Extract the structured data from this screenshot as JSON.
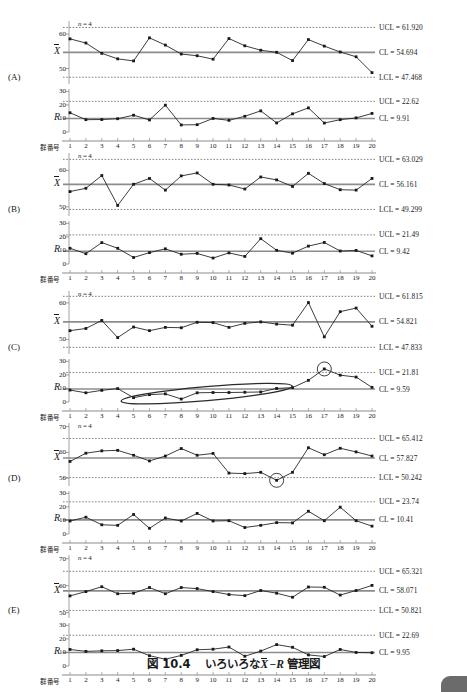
{
  "caption": {
    "number": "図 10.4",
    "text_before": "いろいろな",
    "x_symbol": "X",
    "dash": "−",
    "r_symbol": "R",
    "text_after": "管理図"
  },
  "axis": {
    "group_label": "群番号",
    "n_label": "n = 4",
    "xbar_symbol": "X",
    "r_symbol": "R",
    "x_ticks": [
      "1",
      "2",
      "3",
      "4",
      "5",
      "6",
      "7",
      "8",
      "9",
      "10",
      "11",
      "12",
      "13",
      "14",
      "15",
      "16",
      "17",
      "18",
      "19",
      "20"
    ],
    "y_ticks_xbar_2": [
      "50",
      "60"
    ],
    "y_ticks_xbar_3": [
      "50",
      "60",
      "70"
    ],
    "y_ticks_r": [
      "0",
      "10",
      "20",
      "30"
    ]
  },
  "panels": [
    {
      "letter": "(A)",
      "n_label": "n = 4",
      "xbar": {
        "ucl_label": "UCL = 61.920",
        "cl_label": "CL = 54.694",
        "lcl_label": "LCL = 47.468",
        "ucl": 61.92,
        "cl": 54.694,
        "lcl": 47.468,
        "ymin": 45.5,
        "ymax": 63.5,
        "yticks": [
          50,
          60
        ],
        "values": [
          58.6,
          57.4,
          54.4,
          52.8,
          52.2,
          58.9,
          56.8,
          54.2,
          53.7,
          52.7,
          58.7,
          56.6,
          55.3,
          54.7,
          52.3,
          58.4,
          56.5,
          54.8,
          53.4,
          48.8
        ]
      },
      "r": {
        "ucl_label": "UCL = 22.62",
        "cl_label": "CL = 9.91",
        "ucl": 22.62,
        "cl": 9.91,
        "ymin": 0,
        "ymax": 31,
        "yticks": [
          0,
          10,
          20,
          30
        ],
        "values": [
          14.2,
          9.1,
          9.2,
          9.8,
          12.4,
          8.9,
          19.8,
          5.2,
          5.4,
          10.0,
          8.6,
          11.6,
          15.6,
          6.7,
          13.4,
          17.8,
          6.6,
          9.1,
          10.4,
          13.7
        ]
      },
      "annotations": []
    },
    {
      "letter": "(B)",
      "n_label": "n = 4",
      "xbar": {
        "ucl_label": "UCL = 63.029",
        "cl_label": "CL = 56.161",
        "lcl_label": "LCL = 49.299",
        "ucl": 63.029,
        "cl": 56.161,
        "lcl": 49.299,
        "ymin": 47.5,
        "ymax": 64.5,
        "yticks": [
          50,
          60
        ],
        "values": [
          54.2,
          55.1,
          58.6,
          50.4,
          56.2,
          57.8,
          54.6,
          58.5,
          59.3,
          56.2,
          56.0,
          54.9,
          58.2,
          57.4,
          55.6,
          59.2,
          56.4,
          54.7,
          54.6,
          57.8
        ]
      },
      "r": {
        "ucl_label": "UCL = 21.49",
        "cl_label": "CL = 9.42",
        "ucl": 21.49,
        "cl": 9.42,
        "ymin": 0,
        "ymax": 31,
        "yticks": [
          0,
          10,
          20,
          30
        ],
        "values": [
          11.6,
          7.6,
          15.8,
          11.6,
          4.8,
          8.4,
          11.2,
          7.2,
          7.8,
          4.4,
          8.2,
          5.6,
          18.7,
          10.1,
          8.0,
          13.2,
          15.9,
          9.6,
          10.0,
          6.0
        ]
      },
      "annotations": []
    },
    {
      "letter": "(C)",
      "n_label": "n = 4",
      "xbar": {
        "ucl_label": "UCL = 61.815",
        "cl_label": "CL = 54.821",
        "lcl_label": "LCL = 47.833",
        "ucl": 61.815,
        "cl": 54.821,
        "lcl": 47.833,
        "ymin": 46.0,
        "ymax": 63.0,
        "yticks": [
          50,
          60
        ],
        "values": [
          52.4,
          53.0,
          55.2,
          50.5,
          53.4,
          52.4,
          53.3,
          53.2,
          54.7,
          54.6,
          53.3,
          54.4,
          54.8,
          54.2,
          53.9,
          60.1,
          50.7,
          57.6,
          58.6,
          53.6
        ]
      },
      "r": {
        "ucl_label": "UCL = 21.81",
        "cl_label": "CL = 9.59",
        "ucl": 21.81,
        "cl": 9.59,
        "ymin": 0,
        "ymax": 31,
        "yticks": [
          0,
          10,
          20,
          30
        ],
        "values": [
          8.8,
          6.8,
          8.6,
          9.9,
          3.2,
          5.4,
          6.0,
          2.2,
          6.8,
          7.0,
          7.0,
          7.2,
          7.4,
          10.0,
          10.6,
          16.0,
          24.4,
          19.8,
          18.4,
          10.8
        ]
      },
      "annotations": [
        {
          "type": "ellipse",
          "chart": "r",
          "x_center": 9.6,
          "y_center": 6.2,
          "rx_groups": 5.4,
          "ry_value": 5.2,
          "rotate": -5
        },
        {
          "type": "circle",
          "chart": "r",
          "x_center": 17,
          "y_center": 24.4,
          "r_px": 7
        }
      ]
    },
    {
      "letter": "(D)",
      "n_label": "n = 4",
      "xbar": {
        "ucl_label": "UCL = 65.412",
        "cl_label": "CL = 57.827",
        "lcl_label": "LCL = 50.242",
        "ucl": 65.412,
        "cl": 57.827,
        "lcl": 50.242,
        "ymin": 47.0,
        "ymax": 71.0,
        "yticks": [
          50,
          60,
          70
        ],
        "values": [
          56.5,
          59.7,
          60.6,
          60.8,
          58.9,
          56.7,
          58.6,
          61.5,
          58.9,
          59.6,
          52.0,
          51.8,
          52.3,
          49.2,
          52.3,
          61.8,
          59.1,
          61.6,
          60.2,
          58.6
        ]
      },
      "r": {
        "ucl_label": "UCL = 23.74",
        "cl_label": "CL = 10.41",
        "ucl": 23.74,
        "cl": 10.41,
        "ymin": 0,
        "ymax": 31,
        "yticks": [
          0,
          10,
          20,
          30
        ],
        "values": [
          9.6,
          12.4,
          6.8,
          6.4,
          14.4,
          4.2,
          11.8,
          9.6,
          15.2,
          9.6,
          9.8,
          4.8,
          6.4,
          8.4,
          8.2,
          16.8,
          9.8,
          19.8,
          9.8,
          5.8
        ]
      },
      "annotations": [
        {
          "type": "circle",
          "chart": "xbar",
          "x_center": 14,
          "y_center": 49.2,
          "r_px": 7
        }
      ]
    },
    {
      "letter": "(E)",
      "n_label": "n = 4",
      "xbar": {
        "ucl_label": "UCL = 65.321",
        "cl_label": "CL = 58.071",
        "lcl_label": "LCL = 50.821",
        "ucl": 65.321,
        "cl": 58.071,
        "lcl": 50.821,
        "ymin": 48.0,
        "ymax": 71.0,
        "yticks": [
          50,
          60,
          70
        ],
        "values": [
          56.2,
          57.8,
          59.6,
          57.0,
          57.2,
          59.3,
          57.0,
          59.3,
          58.9,
          57.8,
          56.7,
          56.3,
          58.2,
          57.2,
          55.7,
          59.5,
          59.4,
          56.5,
          58.2,
          60.1
        ]
      },
      "r": {
        "ucl_label": "UCL = 22.69",
        "cl_label": "CL = 9.95",
        "ucl": 22.69,
        "cl": 9.95,
        "ymin": 0,
        "ymax": 31,
        "yticks": [
          0,
          10,
          20,
          30
        ],
        "values": [
          12.2,
          10.8,
          11.2,
          11.4,
          12.4,
          7.6,
          5.0,
          7.8,
          12.0,
          12.4,
          14.0,
          7.2,
          11.0,
          15.8,
          13.8,
          8.2,
          7.0,
          12.2,
          10.0,
          9.8
        ]
      },
      "annotations": []
    }
  ],
  "colors": {
    "ink": "#1a1a1a",
    "center_line": "#8c8c8c",
    "limit_line": "#4a4a4a",
    "axis": "#8c8c8c",
    "annotation": "#2b2b2b"
  }
}
